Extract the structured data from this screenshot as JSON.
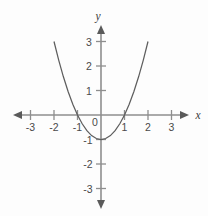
{
  "figure": {
    "background_color": "#fdfdfd",
    "axis_color": "#8e8e8e",
    "curve_color": "#5e5e5e",
    "label_color": "#4a4a4a",
    "x_axis_name": "x",
    "y_axis_name": "y",
    "origin_label": "0"
  },
  "chart_data": {
    "type": "line",
    "title": "",
    "subtitle": "",
    "xlabel": "x",
    "ylabel": "y",
    "xlim": [
      -3.7,
      3.7
    ],
    "ylim": [
      -3.9,
      4.1
    ],
    "grid": false,
    "legend": null,
    "equation": "y = x^2 - 1",
    "vertex": [
      0,
      -1
    ],
    "roots": [
      -1,
      1
    ],
    "x_ticks": [
      -3,
      -2,
      -1,
      1,
      2,
      3
    ],
    "x_tick_labels": [
      "-3",
      "-2",
      "-1",
      "1",
      "2",
      "3"
    ],
    "y_ticks": [
      3,
      2,
      1,
      -1,
      -2,
      -3
    ],
    "y_tick_labels": [
      "3",
      "2",
      "1",
      "-1",
      "-2",
      "-3"
    ],
    "origin_tick_label": "0",
    "series": [
      {
        "name": "y = x^2 - 1",
        "x": [
          -2.0,
          -1.8,
          -1.6,
          -1.4,
          -1.2,
          -1.0,
          -0.8,
          -0.6,
          -0.4,
          -0.2,
          0.0,
          0.2,
          0.4,
          0.6,
          0.8,
          1.0,
          1.2,
          1.4,
          1.6,
          1.8,
          2.0
        ],
        "values": [
          3.0,
          2.24,
          1.56,
          0.96,
          0.44,
          0.0,
          -0.36,
          -0.64,
          -0.84,
          -0.96,
          -1.0,
          -0.96,
          -0.84,
          -0.64,
          -0.36,
          0.0,
          0.44,
          0.96,
          1.56,
          2.24,
          3.0
        ]
      }
    ]
  }
}
